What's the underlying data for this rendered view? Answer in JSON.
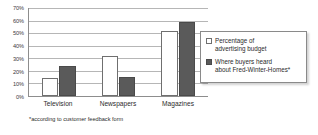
{
  "chart_data": {
    "type": "bar",
    "title": "",
    "subtitle": "",
    "xlabel": "",
    "ylabel": "",
    "categories": [
      "Television",
      "Newspapers",
      "Magazines"
    ],
    "series": [
      {
        "name": "Percentage of advertising budget",
        "color": "#ffffff",
        "values": [
          14,
          32,
          52
        ]
      },
      {
        "name": "Where buyers heard about Fred-Winter-Homes*",
        "color": "#5a5a5a",
        "values": [
          24,
          15.5,
          59
        ]
      }
    ],
    "ylim": [
      0,
      70
    ],
    "ytick_step": 10,
    "ytick_labels": [
      "0%",
      "10%",
      "20%",
      "30%",
      "40%",
      "50%",
      "60%",
      "70%"
    ],
    "ytick_values": [
      0,
      10,
      20,
      30,
      40,
      50,
      60,
      70
    ],
    "grid": true,
    "grid_axis": "y",
    "legend_position": "center-right",
    "legend_entries": [
      {
        "label_line_1": "Percentage of",
        "label_line_2": "advertising budget",
        "swatch_color": "#ffffff"
      },
      {
        "label_line_1": "Where buyers heard",
        "label_line_2": "about Fred-Winter-Homes*",
        "swatch_color": "#5a5a5a"
      }
    ],
    "annotations": [
      "*according to customer feedback form"
    ]
  },
  "footnote": {
    "text": "*according to customer feedback form"
  },
  "watermark": {
    "text": ""
  }
}
